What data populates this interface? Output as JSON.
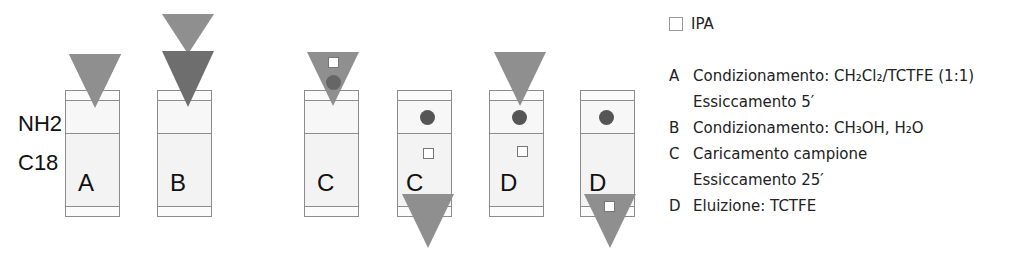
{
  "side_labels": {
    "nh2": "NH2",
    "c18": "C18"
  },
  "columns": [
    {
      "id": "A",
      "label": "A"
    },
    {
      "id": "B",
      "label": "B"
    },
    {
      "id": "C1",
      "label": "C"
    },
    {
      "id": "C2",
      "label": "C"
    },
    {
      "id": "D1",
      "label": "D"
    },
    {
      "id": "D2",
      "label": "D"
    }
  ],
  "colors": {
    "solvent_triangle": "#8f8f8f",
    "solvent_triangle_dark": "#6e6e6e",
    "analyte_dot": "#555555",
    "ipa_square": "#ffffff",
    "column_border": "#8c8c8c"
  },
  "legend": {
    "ipa_label": "IPA",
    "steps": [
      {
        "key": "A",
        "text": "Condizionamento: CH₂Cl₂/TCTFE (1:1)"
      },
      {
        "key": "",
        "text": "Essiccamento 5′"
      },
      {
        "key": "B",
        "text": "Condizionamento: CH₃OH, H₂O"
      },
      {
        "key": "C",
        "text": "Caricamento campione"
      },
      {
        "key": "",
        "text": "Essiccamento 25′"
      },
      {
        "key": "D",
        "text": "Eluizione: TCTFE"
      }
    ]
  }
}
